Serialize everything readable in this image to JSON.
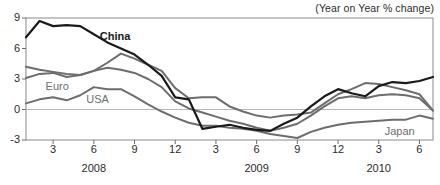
{
  "chart_data": {
    "type": "line",
    "title": "",
    "subtitle": "",
    "unit_note": "(Year on Year % change)",
    "xlabel": "",
    "ylabel": "",
    "ylim": [
      -3,
      9
    ],
    "yticks": [
      9,
      6,
      3,
      0,
      -3
    ],
    "ytick_labels": [
      "9",
      "6",
      "3",
      "0",
      "-3"
    ],
    "grid": false,
    "zero_line": true,
    "legend_position": "inline-annotations",
    "x": [
      "2008-01",
      "2008-02",
      "2008-03",
      "2008-04",
      "2008-05",
      "2008-06",
      "2008-07",
      "2008-08",
      "2008-09",
      "2008-10",
      "2008-11",
      "2008-12",
      "2009-01",
      "2009-02",
      "2009-03",
      "2009-04",
      "2009-05",
      "2009-06",
      "2009-07",
      "2009-08",
      "2009-09",
      "2009-10",
      "2009-11",
      "2009-12",
      "2010-01",
      "2010-02",
      "2010-03",
      "2010-04",
      "2010-05",
      "2010-06",
      "2010-07"
    ],
    "xtick_labels": [
      "3",
      "6",
      "9",
      "12",
      "3",
      "6",
      "9",
      "12",
      "3",
      "6"
    ],
    "xtick_positions": [
      "2008-03",
      "2008-06",
      "2008-09",
      "2008-12",
      "2009-03",
      "2009-06",
      "2009-09",
      "2009-12",
      "2010-03",
      "2010-06"
    ],
    "year_labels": [
      "2008",
      "2009",
      "2010"
    ],
    "year_label_positions": [
      "2008-06",
      "2009-06",
      "2010-03"
    ],
    "series": [
      {
        "name": "China",
        "color": "#1a1a1a",
        "width": 2.2,
        "label_x": "2008-06",
        "label_y": 7.1,
        "values": [
          7.1,
          8.7,
          8.2,
          8.3,
          8.2,
          7.4,
          6.6,
          6.0,
          5.4,
          4.4,
          3.3,
          1.2,
          1.0,
          -1.9,
          -1.7,
          -1.5,
          -1.8,
          -2.0,
          -2.1,
          -1.4,
          -0.8,
          0.3,
          1.3,
          2.0,
          1.6,
          1.3,
          2.3,
          2.7,
          2.6,
          2.8,
          3.2
        ]
      },
      {
        "name": "Euro",
        "color": "#6d6d6d",
        "width": 2.0,
        "label_x": "2008-02",
        "label_y": 2.2,
        "values": [
          4.2,
          3.9,
          3.7,
          3.5,
          3.4,
          3.8,
          4.6,
          5.5,
          5.0,
          4.4,
          3.8,
          2.1,
          1.1,
          1.2,
          1.2,
          0.3,
          -0.2,
          -0.6,
          -0.8,
          -0.6,
          -0.5,
          -0.3,
          0.6,
          1.5,
          2.0,
          2.6,
          2.5,
          2.2,
          1.9,
          1.5,
          -0.1
        ]
      },
      {
        "name": "USA",
        "color": "#6d6d6d",
        "width": 2.0,
        "label_x": "2008-05",
        "label_y": 0.9,
        "values": [
          3.1,
          3.5,
          3.6,
          3.2,
          3.4,
          3.8,
          4.1,
          3.9,
          3.6,
          3.0,
          2.2,
          0.8,
          0.1,
          -0.3,
          -0.7,
          -1.1,
          -1.4,
          -1.8,
          -2.1,
          -1.8,
          -1.4,
          -0.6,
          0.3,
          1.1,
          1.3,
          1.1,
          1.4,
          1.5,
          1.4,
          1.1,
          -0.1
        ]
      },
      {
        "name": "Japan",
        "color": "#6d6d6d",
        "width": 2.0,
        "label_x": "2010-03",
        "label_y": -2.2,
        "values": [
          0.6,
          1.0,
          1.2,
          0.9,
          1.4,
          2.2,
          2.0,
          2.0,
          1.3,
          0.5,
          -0.2,
          -0.8,
          -1.3,
          -1.6,
          -1.6,
          -1.8,
          -1.9,
          -2.1,
          -2.4,
          -2.6,
          -2.8,
          -2.2,
          -1.8,
          -1.5,
          -1.3,
          -1.2,
          -1.1,
          -1.0,
          -1.0,
          -0.6,
          -0.9
        ]
      }
    ]
  }
}
